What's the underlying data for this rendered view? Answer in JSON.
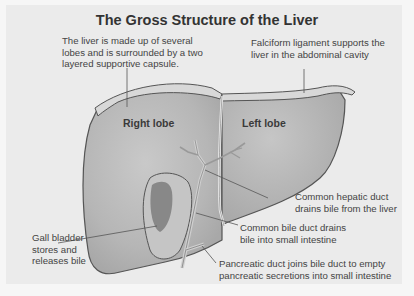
{
  "title": "The Gross Structure of the Liver",
  "labels": {
    "capsule": [
      "The liver is made up of several",
      "lobes and is surrounded by a two",
      "layered supportive capsule."
    ],
    "falciform": [
      "Falciform ligament supports the",
      "liver in the abdominal cavity"
    ],
    "right_lobe": "Right lobe",
    "left_lobe": "Left lobe",
    "hepatic_duct": [
      "Common hepatic duct",
      "drains bile from the liver"
    ],
    "bile_duct": [
      "Common bile duct drains",
      "bile into small intestine"
    ],
    "gall_bladder": [
      "Gall bladder",
      "stores and",
      "releases bile"
    ],
    "pancreatic_duct": [
      "Pancreatic duct joins bile duct to empty",
      "pancreatic secretions into small intestine"
    ]
  },
  "colors": {
    "background": "#ebebeb",
    "liver_fill": "#b4b4b4",
    "liver_highlight": "#c8c8c8",
    "capsule": "#d6d6d6",
    "outline": "#555555",
    "gall_bladder_dark": "#7a7a7a",
    "duct": "#cfcfcf"
  }
}
